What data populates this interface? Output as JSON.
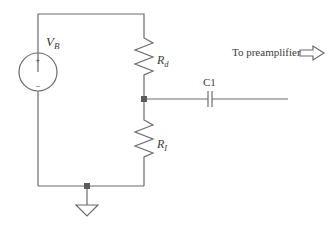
{
  "diagram": {
    "type": "circuit-schematic",
    "components": {
      "voltage_source": {
        "label_main": "V",
        "label_sub": "B",
        "plus_sign": "+",
        "minus_sign": "−"
      },
      "resistor_d": {
        "label_main": "R",
        "label_sub": "d"
      },
      "resistor_i": {
        "label_main": "R",
        "label_sub": "I"
      },
      "capacitor": {
        "label": "C1"
      },
      "ground": {
        "symbol": "ground-triangle"
      }
    },
    "output": {
      "label": "To preamplifier",
      "arrow_icon": "right-hollow-arrow-icon"
    },
    "colors": {
      "wire": "#6b6b6b",
      "node": "#5a5a5a",
      "text": "#3a3a3a",
      "background": "#ffffff"
    }
  }
}
